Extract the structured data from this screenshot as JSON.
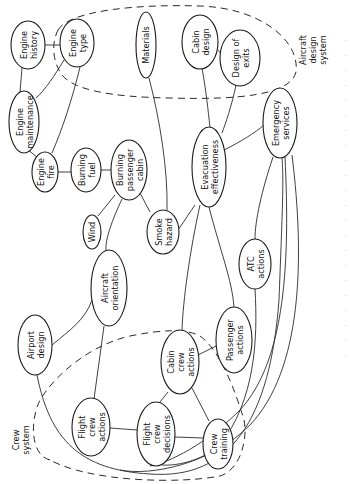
{
  "diagram": {
    "type": "influence-diagram",
    "orientation": "rotated-90-ccw",
    "systems": {
      "aircraft_design": {
        "label_lines": [
          "Aircraft",
          "design",
          "system"
        ]
      },
      "crew": {
        "label_lines": [
          "Crew",
          "system"
        ]
      }
    },
    "nodes": {
      "engine_history": {
        "lines": [
          "Engine",
          "history"
        ]
      },
      "engine_type": {
        "lines": [
          "Engine",
          "type"
        ]
      },
      "engine_maintenance": {
        "lines": [
          "Engine",
          "maintenance"
        ]
      },
      "engine_fire": {
        "lines": [
          "Engine",
          "fire"
        ]
      },
      "burning_fuel": {
        "lines": [
          "Burning",
          "fuel"
        ]
      },
      "burning_passenger_cabin": {
        "lines": [
          "Burning",
          "passenger",
          "cabin"
        ]
      },
      "wind": {
        "lines": [
          "Wind"
        ]
      },
      "smoke_hazard": {
        "lines": [
          "Smoke",
          "hazard"
        ]
      },
      "materials": {
        "lines": [
          "Materials"
        ]
      },
      "cabin_design": {
        "lines": [
          "Cabin",
          "design"
        ]
      },
      "design_of_exits": {
        "lines": [
          "Design of",
          "exits"
        ]
      },
      "evacuation_effectiveness": {
        "lines": [
          "Evacuation",
          "effectiveness"
        ]
      },
      "emergency_services": {
        "lines": [
          "Emergency",
          "services"
        ]
      },
      "atc_actions": {
        "lines": [
          "ATC",
          "actions"
        ]
      },
      "aircraft_orientation": {
        "lines": [
          "Aircraft",
          "orientation"
        ]
      },
      "airport_design": {
        "lines": [
          "Airport",
          "design"
        ]
      },
      "passenger_actions": {
        "lines": [
          "Passenger",
          "actions"
        ]
      },
      "cabin_crew_actions": {
        "lines": [
          "Cabin",
          "crew",
          "actions"
        ]
      },
      "flight_crew_actions": {
        "lines": [
          "Flight",
          "crew",
          "actions"
        ]
      },
      "flight_crew_decisions": {
        "lines": [
          "Flight",
          "crew",
          "decisions"
        ]
      },
      "crew_training": {
        "lines": [
          "Crew",
          "training"
        ]
      }
    },
    "edges": [
      [
        "engine_history",
        "engine_type"
      ],
      [
        "engine_history",
        "engine_maintenance"
      ],
      [
        "engine_type",
        "engine_maintenance"
      ],
      [
        "engine_type",
        "engine_fire"
      ],
      [
        "engine_maintenance",
        "engine_fire"
      ],
      [
        "engine_fire",
        "burning_fuel"
      ],
      [
        "burning_fuel",
        "burning_passenger_cabin"
      ],
      [
        "wind",
        "burning_passenger_cabin"
      ],
      [
        "burning_passenger_cabin",
        "smoke_hazard"
      ],
      [
        "burning_passenger_cabin",
        "aircraft_orientation"
      ],
      [
        "materials",
        "smoke_hazard"
      ],
      [
        "smoke_hazard",
        "evacuation_effectiveness"
      ],
      [
        "cabin_design",
        "design_of_exits"
      ],
      [
        "cabin_design",
        "evacuation_effectiveness"
      ],
      [
        "design_of_exits",
        "evacuation_effectiveness"
      ],
      [
        "evacuation_effectiveness",
        "emergency_services"
      ],
      [
        "evacuation_effectiveness",
        "passenger_actions"
      ],
      [
        "evacuation_effectiveness",
        "cabin_crew_actions"
      ],
      [
        "emergency_services",
        "atc_actions"
      ],
      [
        "emergency_services",
        "flight_crew_decisions"
      ],
      [
        "emergency_services",
        "flight_crew_actions"
      ],
      [
        "atc_actions",
        "flight_crew_decisions"
      ],
      [
        "airport_design",
        "aircraft_orientation"
      ],
      [
        "airport_design",
        "flight_crew_decisions"
      ],
      [
        "aircraft_orientation",
        "flight_crew_actions"
      ],
      [
        "flight_crew_actions",
        "flight_crew_decisions"
      ],
      [
        "flight_crew_decisions",
        "cabin_crew_actions"
      ],
      [
        "flight_crew_decisions",
        "crew_training"
      ],
      [
        "cabin_crew_actions",
        "crew_training"
      ],
      [
        "cabin_crew_actions",
        "passenger_actions"
      ]
    ]
  }
}
